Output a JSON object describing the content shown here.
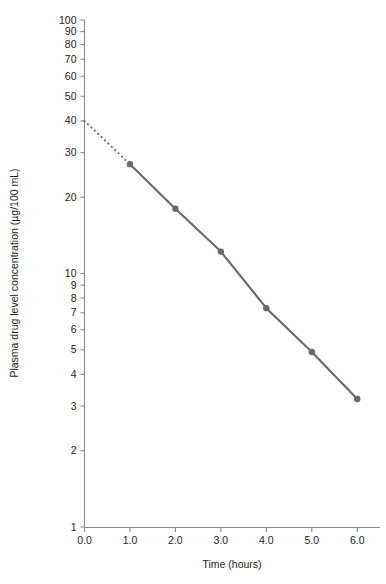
{
  "chart_data": {
    "type": "line",
    "title": "",
    "xlabel": "Time (hours)",
    "ylabel": "Plasma drug level concentration (µg/100 mL)",
    "yscale": "log",
    "xscale": "linear",
    "xlim": [
      0.0,
      6.5
    ],
    "ylim": [
      1,
      100
    ],
    "grid": false,
    "legend": null,
    "x": [
      1.0,
      2.0,
      3.0,
      4.0,
      5.0,
      6.0
    ],
    "values": [
      27.0,
      18.0,
      12.2,
      7.3,
      4.9,
      3.2
    ],
    "series": [
      {
        "name": "Observed plasma drug level",
        "style": "solid-line-with-markers",
        "color": "#6a6a6a",
        "x": [
          1.0,
          2.0,
          3.0,
          4.0,
          5.0,
          6.0
        ],
        "values": [
          27.0,
          18.0,
          12.2,
          7.3,
          4.9,
          3.2
        ]
      },
      {
        "name": "Extrapolated back to time zero",
        "style": "dotted-line",
        "color": "#6a6a6a",
        "x": [
          0.0,
          1.0
        ],
        "values": [
          40.0,
          27.0
        ]
      }
    ],
    "xticks": [
      0.0,
      1.0,
      2.0,
      3.0,
      4.0,
      5.0,
      6.0
    ],
    "xticklabels": [
      "0.0",
      "1.0",
      "2.0",
      "3.0",
      "4.0",
      "5.0",
      "6.0"
    ],
    "yticks": [
      1,
      2,
      3,
      4,
      5,
      6,
      7,
      8,
      9,
      10,
      20,
      30,
      40,
      50,
      60,
      70,
      80,
      90,
      100
    ],
    "yticklabels": [
      "1",
      "2",
      "3",
      "4",
      "5",
      "6",
      "7",
      "8",
      "9",
      "10",
      "20",
      "30",
      "40",
      "50",
      "60",
      "70",
      "80",
      "90",
      "100"
    ],
    "annotations": []
  },
  "style": {
    "axis_color": "#8a8a8a",
    "text_color": "#231f20",
    "line_color": "#6a6a6a",
    "marker_color": "#6a6a6a",
    "background": "#ffffff"
  }
}
